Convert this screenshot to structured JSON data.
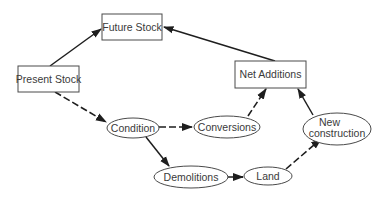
{
  "diagram": {
    "nodes": {
      "future_stock": {
        "label": "Future Stock",
        "shape": "rectangle"
      },
      "present_stock": {
        "label": "Present Stock",
        "shape": "rectangle"
      },
      "net_additions": {
        "label": "Net Additions",
        "shape": "rectangle"
      },
      "condition": {
        "label": "Condition",
        "shape": "ellipse"
      },
      "conversions": {
        "label": "Conversions",
        "shape": "ellipse"
      },
      "new_construction": {
        "label_line1": "New",
        "label_line2": "construction",
        "shape": "ellipse"
      },
      "demolitions": {
        "label": "Demolitions",
        "shape": "ellipse"
      },
      "land": {
        "label": "Land",
        "shape": "ellipse"
      }
    },
    "edges": [
      {
        "from": "Present Stock",
        "to": "Future Stock",
        "style": "solid"
      },
      {
        "from": "Net Additions",
        "to": "Future Stock",
        "style": "solid"
      },
      {
        "from": "Present Stock",
        "to": "Condition",
        "style": "dashed"
      },
      {
        "from": "Condition",
        "to": "Conversions",
        "style": "dashed"
      },
      {
        "from": "Condition",
        "to": "Demolitions",
        "style": "solid"
      },
      {
        "from": "Conversions",
        "to": "Net Additions",
        "style": "dashed"
      },
      {
        "from": "New construction",
        "to": "Net Additions",
        "style": "solid"
      },
      {
        "from": "Demolitions",
        "to": "Land",
        "style": "dashed"
      },
      {
        "from": "Land",
        "to": "New construction",
        "style": "dashed"
      }
    ],
    "colors": {
      "line": "#1e1e1e",
      "border": "#4a4a4a",
      "text": "#3a3a3a",
      "background": "#ffffff"
    }
  }
}
